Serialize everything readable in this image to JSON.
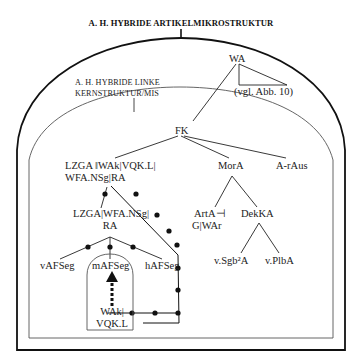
{
  "title": "A. H. HYBRIDE ARTIKELMIKROSTRUKTUR",
  "inner_structure_label": [
    "A. H. HYBRIDE LINKE",
    "KERNSTRUKTUR/MIS"
  ],
  "nodes": {
    "wa": "WA",
    "vgl": "(vgl. Abb. 10)",
    "fk": "FK",
    "lzga_line1": "LZGA ‖WAk|VQK.L|",
    "lzga_line2": "WFA.NSg|RA",
    "lzga2_line1": "LZGA|WFA.NSg|",
    "lzga2_line2": "RA",
    "mora": "MorA",
    "a_raus": "A-rAus",
    "arta_line1": "ArtA⊣",
    "arta_line2": "G|WAr",
    "dekka": "DekKA",
    "vsgb": "v.Sgb²A",
    "vplba": "v.PlbA",
    "vafseg": "vAFSeg",
    "mafseg": "mAFSeg",
    "hafseg": "hAFSeg",
    "wak_line1": "WAk|",
    "wak_line2": "VQK.L"
  },
  "colors": {
    "line": "#111111",
    "thin_line": "#444444",
    "background": "#ffffff"
  }
}
